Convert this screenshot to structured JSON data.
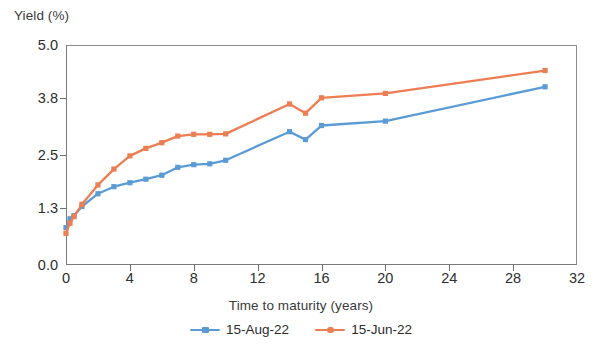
{
  "chart_data": {
    "type": "line",
    "title": "",
    "xlabel": "Time to maturity (years)",
    "ylabel": "Yield (%)",
    "xlim": [
      0,
      32
    ],
    "ylim": [
      0.0,
      5.0
    ],
    "xticks": [
      0,
      4,
      8,
      12,
      16,
      20,
      24,
      28,
      32
    ],
    "xtick_labels": [
      "0",
      "4",
      "8",
      "12",
      "16",
      "20",
      "24",
      "28",
      "32"
    ],
    "yticks": [
      0.0,
      1.3,
      2.5,
      3.8,
      5.0
    ],
    "ytick_labels": [
      "0.0",
      "1.3",
      "2.5",
      "3.8",
      "5.0"
    ],
    "grid": false,
    "legend_position": "bottom-center",
    "marker": "square",
    "series": [
      {
        "name": "15-Aug-22",
        "color": "#5B9BD5",
        "marker": "square",
        "x": [
          0,
          0.25,
          0.5,
          1,
          2,
          3,
          4,
          5,
          6,
          7,
          8,
          9,
          10,
          14,
          15,
          16,
          20,
          30
        ],
        "values": [
          0.85,
          1.05,
          1.12,
          1.33,
          1.62,
          1.78,
          1.87,
          1.95,
          2.04,
          2.22,
          2.28,
          2.3,
          2.38,
          3.03,
          2.85,
          3.17,
          3.27,
          4.05
        ]
      },
      {
        "name": "15-Jun-22",
        "color": "#ED7D52",
        "marker": "circle",
        "x": [
          0,
          0.25,
          0.5,
          1,
          2,
          3,
          4,
          5,
          6,
          7,
          8,
          9,
          10,
          14,
          15,
          16,
          20,
          30
        ],
        "values": [
          0.72,
          0.95,
          1.1,
          1.38,
          1.82,
          2.18,
          2.48,
          2.65,
          2.78,
          2.93,
          2.97,
          2.97,
          2.98,
          3.66,
          3.45,
          3.8,
          3.9,
          4.42
        ]
      }
    ]
  },
  "legend": {
    "items": [
      {
        "label": "15-Aug-22",
        "color": "#5B9BD5"
      },
      {
        "label": "15-Jun-22",
        "color": "#ED7D52"
      }
    ]
  },
  "axes": {
    "y_title": "Yield (%)",
    "x_title": "Time to maturity (years)"
  },
  "colors": {
    "series_blue": "#5B9BD5",
    "series_orange": "#ED7D52",
    "axis": "#6e6e6e",
    "text": "#2b2b2b",
    "background": "#ffffff"
  }
}
